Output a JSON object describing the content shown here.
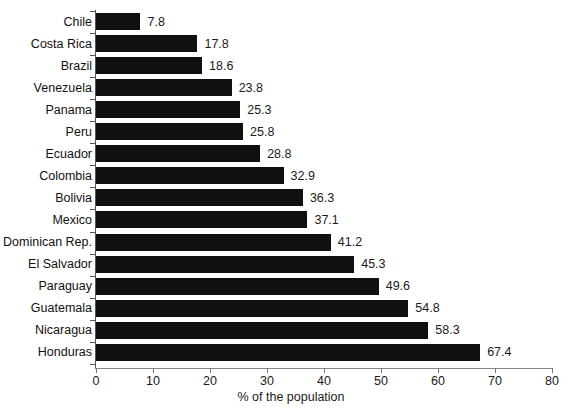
{
  "chart_data": {
    "type": "bar",
    "orientation": "horizontal",
    "title": "",
    "xlabel": "% of the population",
    "ylabel": "",
    "xlim": [
      0,
      80
    ],
    "xticks": [
      0,
      10,
      20,
      30,
      40,
      50,
      60,
      70,
      80
    ],
    "grid": false,
    "legend": null,
    "bar_color": "#101010",
    "background": "#ffffff",
    "value_labels": true,
    "categories": [
      "Chile",
      "Costa Rica",
      "Brazil",
      "Venezuela",
      "Panama",
      "Peru",
      "Ecuador",
      "Colombia",
      "Bolivia",
      "Mexico",
      "Dominican Rep.",
      "El Salvador",
      "Paraguay",
      "Guatemala",
      "Nicaragua",
      "Honduras"
    ],
    "values": [
      7.8,
      17.8,
      18.6,
      23.8,
      25.3,
      25.8,
      28.8,
      32.9,
      36.3,
      37.1,
      41.2,
      45.3,
      49.6,
      54.8,
      58.3,
      67.4
    ],
    "value_label_text": [
      "7.8",
      "17.8",
      "18.6",
      "23.8",
      "25.3",
      "25.8",
      "28.8",
      "32.9",
      "36.3",
      "37.1",
      "41.2",
      "45.3",
      "49.6",
      "54.8",
      "58.3",
      "67.4"
    ],
    "xtick_labels": [
      "0",
      "10",
      "20",
      "30",
      "40",
      "50",
      "60",
      "70",
      "80"
    ]
  }
}
